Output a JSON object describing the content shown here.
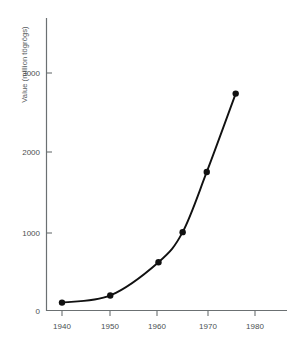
{
  "chart_data": {
    "type": "line",
    "title": "",
    "xlabel": "",
    "ylabel": "Value (million tögrögs)",
    "xlim": [
      1936,
      1984
    ],
    "ylim": [
      0,
      3200
    ],
    "grid": false,
    "legend": null,
    "x": [
      1940,
      1950,
      1960,
      1965,
      1970,
      1976
    ],
    "values": [
      100,
      190,
      610,
      990,
      1750,
      2740
    ],
    "xticks": [
      1940,
      1950,
      1960,
      1970,
      1980
    ],
    "xtick_labels": [
      "1940",
      "1950",
      "1960",
      "1970",
      "1980"
    ],
    "yticks": [
      0,
      1000,
      2000,
      3000
    ],
    "ytick_labels": [
      "0",
      "1000",
      "2000",
      "3000"
    ],
    "marker": "filled-circle",
    "line_color": "#111111",
    "marker_color": "#111111",
    "axis_color": "#6b7072"
  },
  "axes": {
    "y_title": "Value (million tögrögs)"
  },
  "ticks": {
    "y": [
      "3000",
      "2000",
      "1000",
      "0"
    ],
    "x": [
      "1940",
      "1950",
      "1960",
      "1970",
      "1980"
    ]
  }
}
